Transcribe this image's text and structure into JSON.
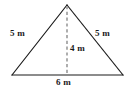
{
  "figure": {
    "type": "isosceles-triangle-with-altitude",
    "background_color": "#ffffff",
    "stroke_color": "#1a1a1a",
    "dashed_color": "#9a9a9a",
    "label_color": "#1a1a1a",
    "geometry": {
      "apex": [
        67,
        5
      ],
      "base_left": [
        12,
        75
      ],
      "base_right": [
        123,
        75
      ],
      "altitude_foot": [
        67,
        75
      ]
    },
    "labels": {
      "left_side": "5 m",
      "right_side": "5 m",
      "altitude": "4 m",
      "base": "6 m"
    }
  }
}
